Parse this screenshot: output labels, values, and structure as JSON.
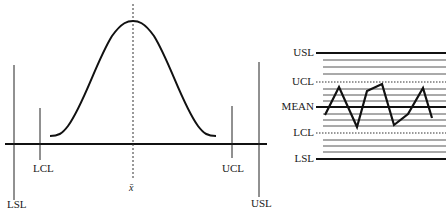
{
  "left_diagram": {
    "title": "Normal distribution with control and specification limits",
    "labels": {
      "lsl": "LSL",
      "lcl": "LCL",
      "mean": "x̄",
      "ucl": "UCL",
      "usl": "USL"
    }
  },
  "right_diagram": {
    "title": "Control chart",
    "labels": {
      "usl": "USL",
      "ucl": "UCL",
      "mean": "MEAN",
      "lcl": "LCL",
      "lsl": "LSL"
    },
    "series_points_y": [
      118,
      88,
      127,
      92,
      85,
      124,
      114,
      88,
      119
    ]
  },
  "colors": {
    "line": "#111111",
    "grid": "#555555",
    "background": "#ffffff"
  }
}
